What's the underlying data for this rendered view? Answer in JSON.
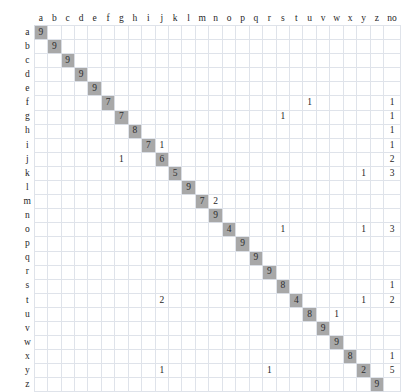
{
  "chart_data": {
    "type": "heatmap",
    "title": "",
    "xlabel": "",
    "ylabel": "",
    "grid": true,
    "legend": "none",
    "column_headers": [
      "a",
      "b",
      "c",
      "d",
      "e",
      "f",
      "g",
      "h",
      "i",
      "j",
      "k",
      "l",
      "m",
      "n",
      "o",
      "p",
      "q",
      "r",
      "s",
      "t",
      "u",
      "v",
      "w",
      "x",
      "y",
      "z",
      "no"
    ],
    "row_headers": [
      "a",
      "b",
      "c",
      "d",
      "e",
      "f",
      "g",
      "h",
      "i",
      "j",
      "k",
      "l",
      "m",
      "n",
      "o",
      "p",
      "q",
      "r",
      "s",
      "t",
      "u",
      "v",
      "w",
      "x",
      "y",
      "z"
    ],
    "diagonal_values": [
      9,
      9,
      9,
      9,
      9,
      7,
      7,
      8,
      7,
      6,
      5,
      9,
      7,
      9,
      4,
      9,
      9,
      9,
      8,
      4,
      8,
      9,
      9,
      8,
      2,
      9
    ],
    "highlight_color": "#a8a8a8",
    "grid_color": "#dfe3ea",
    "rows": [
      {
        "label": "a",
        "values": [
          "9",
          "",
          "",
          "",
          "",
          "",
          "",
          "",
          "",
          "",
          "",
          "",
          "",
          "",
          "",
          "",
          "",
          "",
          "",
          "",
          "",
          "",
          "",
          "",
          "",
          "",
          ""
        ]
      },
      {
        "label": "b",
        "values": [
          "",
          "9",
          "",
          "",
          "",
          "",
          "",
          "",
          "",
          "",
          "",
          "",
          "",
          "",
          "",
          "",
          "",
          "",
          "",
          "",
          "",
          "",
          "",
          "",
          "",
          "",
          ""
        ]
      },
      {
        "label": "c",
        "values": [
          "",
          "",
          "9",
          "",
          "",
          "",
          "",
          "",
          "",
          "",
          "",
          "",
          "",
          "",
          "",
          "",
          "",
          "",
          "",
          "",
          "",
          "",
          "",
          "",
          "",
          "",
          ""
        ]
      },
      {
        "label": "d",
        "values": [
          "",
          "",
          "",
          "9",
          "",
          "",
          "",
          "",
          "",
          "",
          "",
          "",
          "",
          "",
          "",
          "",
          "",
          "",
          "",
          "",
          "",
          "",
          "",
          "",
          "",
          "",
          ""
        ]
      },
      {
        "label": "e",
        "values": [
          "",
          "",
          "",
          "",
          "9",
          "",
          "",
          "",
          "",
          "",
          "",
          "",
          "",
          "",
          "",
          "",
          "",
          "",
          "",
          "",
          "",
          "",
          "",
          "",
          "",
          "",
          ""
        ]
      },
      {
        "label": "f",
        "values": [
          "",
          "",
          "",
          "",
          "",
          "7",
          "",
          "",
          "",
          "",
          "",
          "",
          "",
          "",
          "",
          "",
          "",
          "",
          "",
          "",
          "1",
          "",
          "",
          "",
          "",
          "",
          "1"
        ]
      },
      {
        "label": "g",
        "values": [
          "",
          "",
          "",
          "",
          "",
          "",
          "7",
          "",
          "",
          "",
          "",
          "",
          "",
          "",
          "",
          "",
          "",
          "",
          "1",
          "",
          "",
          "",
          "",
          "",
          "",
          "",
          "1"
        ]
      },
      {
        "label": "h",
        "values": [
          "",
          "",
          "",
          "",
          "",
          "",
          "",
          "8",
          "",
          "",
          "",
          "",
          "",
          "",
          "",
          "",
          "",
          "",
          "",
          "",
          "",
          "",
          "",
          "",
          "",
          "",
          "1"
        ]
      },
      {
        "label": "i",
        "values": [
          "",
          "",
          "",
          "",
          "",
          "",
          "",
          "",
          "7",
          "1",
          "",
          "",
          "",
          "",
          "",
          "",
          "",
          "",
          "",
          "",
          "",
          "",
          "",
          "",
          "",
          "",
          "1"
        ]
      },
      {
        "label": "j",
        "values": [
          "",
          "",
          "",
          "",
          "",
          "",
          "1",
          "",
          "",
          "6",
          "",
          "",
          "",
          "",
          "",
          "",
          "",
          "",
          "",
          "",
          "",
          "",
          "",
          "",
          "",
          "",
          "2"
        ]
      },
      {
        "label": "k",
        "values": [
          "",
          "",
          "",
          "",
          "",
          "",
          "",
          "",
          "",
          "",
          "5",
          "",
          "",
          "",
          "",
          "",
          "",
          "",
          "",
          "",
          "",
          "",
          "",
          "",
          "1",
          "",
          "3"
        ]
      },
      {
        "label": "l",
        "values": [
          "",
          "",
          "",
          "",
          "",
          "",
          "",
          "",
          "",
          "",
          "",
          "9",
          "",
          "",
          "",
          "",
          "",
          "",
          "",
          "",
          "",
          "",
          "",
          "",
          "",
          "",
          ""
        ]
      },
      {
        "label": "m",
        "values": [
          "",
          "",
          "",
          "",
          "",
          "",
          "",
          "",
          "",
          "",
          "",
          "",
          "7",
          "2",
          "",
          "",
          "",
          "",
          "",
          "",
          "",
          "",
          "",
          "",
          "",
          "",
          ""
        ]
      },
      {
        "label": "n",
        "values": [
          "",
          "",
          "",
          "",
          "",
          "",
          "",
          "",
          "",
          "",
          "",
          "",
          "",
          "9",
          "",
          "",
          "",
          "",
          "",
          "",
          "",
          "",
          "",
          "",
          "",
          "",
          ""
        ]
      },
      {
        "label": "o",
        "values": [
          "",
          "",
          "",
          "",
          "",
          "",
          "",
          "",
          "",
          "",
          "",
          "",
          "",
          "",
          "4",
          "",
          "",
          "",
          "1",
          "",
          "",
          "",
          "",
          "",
          "1",
          "",
          "3"
        ]
      },
      {
        "label": "p",
        "values": [
          "",
          "",
          "",
          "",
          "",
          "",
          "",
          "",
          "",
          "",
          "",
          "",
          "",
          "",
          "",
          "9",
          "",
          "",
          "",
          "",
          "",
          "",
          "",
          "",
          "",
          "",
          ""
        ]
      },
      {
        "label": "q",
        "values": [
          "",
          "",
          "",
          "",
          "",
          "",
          "",
          "",
          "",
          "",
          "",
          "",
          "",
          "",
          "",
          "",
          "9",
          "",
          "",
          "",
          "",
          "",
          "",
          "",
          "",
          "",
          ""
        ]
      },
      {
        "label": "r",
        "values": [
          "",
          "",
          "",
          "",
          "",
          "",
          "",
          "",
          "",
          "",
          "",
          "",
          "",
          "",
          "",
          "",
          "",
          "9",
          "",
          "",
          "",
          "",
          "",
          "",
          "",
          "",
          ""
        ]
      },
      {
        "label": "s",
        "values": [
          "",
          "",
          "",
          "",
          "",
          "",
          "",
          "",
          "",
          "",
          "",
          "",
          "",
          "",
          "",
          "",
          "",
          "",
          "8",
          "",
          "",
          "",
          "",
          "",
          "",
          "",
          "1"
        ]
      },
      {
        "label": "t",
        "values": [
          "",
          "",
          "",
          "",
          "",
          "",
          "",
          "",
          "",
          "2",
          "",
          "",
          "",
          "",
          "",
          "",
          "",
          "",
          "",
          "4",
          "",
          "",
          "",
          "",
          "1",
          "",
          "2"
        ]
      },
      {
        "label": "u",
        "values": [
          "",
          "",
          "",
          "",
          "",
          "",
          "",
          "",
          "",
          "",
          "",
          "",
          "",
          "",
          "",
          "",
          "",
          "",
          "",
          "",
          "8",
          "",
          "1",
          "",
          "",
          "",
          ""
        ]
      },
      {
        "label": "v",
        "values": [
          "",
          "",
          "",
          "",
          "",
          "",
          "",
          "",
          "",
          "",
          "",
          "",
          "",
          "",
          "",
          "",
          "",
          "",
          "",
          "",
          "",
          "9",
          "",
          "",
          "",
          "",
          ""
        ]
      },
      {
        "label": "w",
        "values": [
          "",
          "",
          "",
          "",
          "",
          "",
          "",
          "",
          "",
          "",
          "",
          "",
          "",
          "",
          "",
          "",
          "",
          "",
          "",
          "",
          "",
          "",
          "9",
          "",
          "",
          "",
          ""
        ]
      },
      {
        "label": "x",
        "values": [
          "",
          "",
          "",
          "",
          "",
          "",
          "",
          "",
          "",
          "",
          "",
          "",
          "",
          "",
          "",
          "",
          "",
          "",
          "",
          "",
          "",
          "",
          "",
          "8",
          "",
          "",
          "1"
        ]
      },
      {
        "label": "y",
        "values": [
          "",
          "",
          "",
          "",
          "",
          "",
          "",
          "",
          "",
          "1",
          "",
          "",
          "",
          "",
          "",
          "",
          "",
          "1",
          "",
          "",
          "",
          "",
          "",
          "",
          "2",
          "",
          "5"
        ]
      },
      {
        "label": "z",
        "values": [
          "",
          "",
          "",
          "",
          "",
          "",
          "",
          "",
          "",
          "",
          "",
          "",
          "",
          "",
          "",
          "",
          "",
          "",
          "",
          "",
          "",
          "",
          "",
          "",
          "",
          "9",
          ""
        ]
      }
    ]
  }
}
